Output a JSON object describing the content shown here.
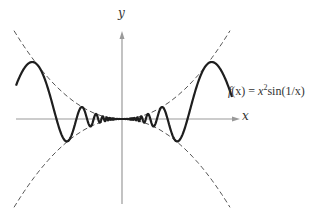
{
  "chart_data": {
    "type": "line",
    "title": "",
    "xlabel": "x",
    "ylabel": "y",
    "annotations": [
      "f(x) = x² sin(1/x)"
    ],
    "series": [
      {
        "name": "f(x) = x^2 sin(1/x)",
        "style": "solid",
        "color": "#222222"
      },
      {
        "name": "y = x^2",
        "style": "dashed",
        "color": "#555555"
      },
      {
        "name": "y = -x^2",
        "style": "dashed",
        "color": "#555555"
      }
    ],
    "grid": false,
    "legend": "none",
    "ticks": "none"
  },
  "labels": {
    "x_axis": "x",
    "y_axis": "y",
    "formula_prefix": "f",
    "formula_arg": "(x) = ",
    "formula_x": "x",
    "formula_exp": "2",
    "formula_rest": "sin(1/x)"
  },
  "colors": {
    "axis": "#9a9a9a",
    "curve": "#1e1e1e",
    "envelope": "#555555"
  }
}
